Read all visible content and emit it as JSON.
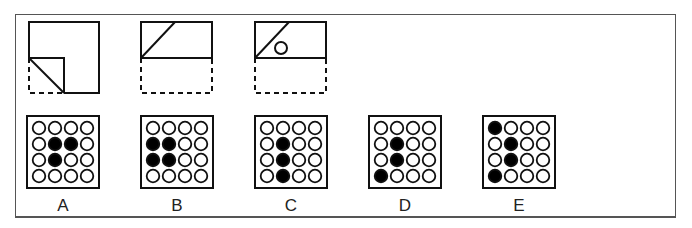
{
  "puzzle": {
    "type": "paper-folding-punch",
    "steps": [
      {
        "id": "step-1",
        "description": "square folded: bottom-left corner folded up"
      },
      {
        "id": "step-2",
        "description": "folded in half bottom to top"
      },
      {
        "id": "step-3",
        "description": "hole punched"
      }
    ]
  },
  "options": [
    {
      "label": "A",
      "filled": [
        [
          1,
          1
        ],
        [
          1,
          2
        ],
        [
          2,
          1
        ]
      ]
    },
    {
      "label": "B",
      "filled": [
        [
          1,
          0
        ],
        [
          1,
          1
        ],
        [
          2,
          0
        ],
        [
          2,
          1
        ]
      ]
    },
    {
      "label": "C",
      "filled": [
        [
          1,
          1
        ],
        [
          2,
          1
        ],
        [
          3,
          1
        ]
      ]
    },
    {
      "label": "D",
      "filled": [
        [
          1,
          1
        ],
        [
          2,
          1
        ],
        [
          3,
          0
        ]
      ]
    },
    {
      "label": "E",
      "filled": [
        [
          0,
          0
        ],
        [
          1,
          1
        ],
        [
          2,
          1
        ],
        [
          3,
          0
        ]
      ]
    }
  ],
  "colors": {
    "stroke": "#111111",
    "frame": "#555555",
    "fill": "#000000",
    "background": "#ffffff"
  }
}
